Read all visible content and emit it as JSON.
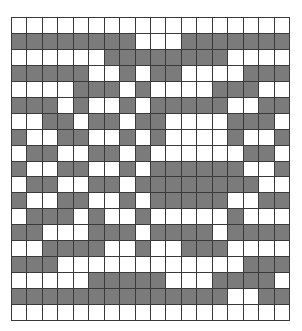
{
  "grid": {
    "rows": 19,
    "cols": 18,
    "colors": {
      "filled": "#7b7b7b",
      "empty": "#ffffff",
      "line": "#3a3a3a"
    },
    "cells": [
      "000000000000000000",
      "111111110001111111",
      "000000111111110000",
      "111110010110000111",
      "000011101000011100",
      "111010010111110011",
      "001101101100001110",
      "100110010100001001",
      "011001101000000110",
      "100110010111111001",
      "011001101111111100",
      "100110010111110011",
      "011101001000001000",
      "110001110111101111",
      "001111001001110000",
      "111000000000000111",
      "000001111100011110",
      "111111111111110011",
      "000000000000000000"
    ]
  }
}
